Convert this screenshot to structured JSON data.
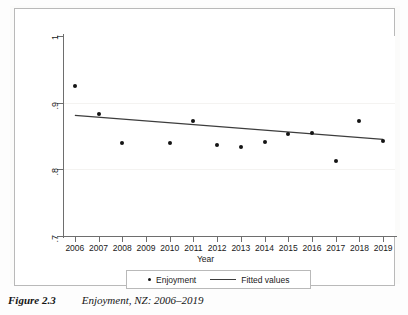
{
  "caption": {
    "number": "Figure 2.3",
    "text": "Enjoyment, NZ: 2006–2019"
  },
  "legend": {
    "series_label": "Enjoyment",
    "fit_label": "Fitted values",
    "marker_icon": "filled-circle-marker-icon",
    "line_icon": "solid-line-icon"
  },
  "axes": {
    "x_title": "Year",
    "y_title": "",
    "y_ticks": [
      "1",
      ".9",
      ".8",
      ".7"
    ],
    "x_ticks": [
      "2006",
      "2007",
      "2008",
      "2009",
      "2010",
      "2011",
      "2012",
      "2013",
      "2014",
      "2015",
      "2016",
      "2017",
      "2018",
      "2019"
    ]
  },
  "colors": {
    "marker": "#141414",
    "fit_line": "#3d3d3d",
    "axis": "#6e6e6e",
    "frame": "#b9b9b9",
    "background": "#ffffff"
  },
  "chart_data": {
    "type": "scatter",
    "title": "Enjoyment, NZ: 2006–2019",
    "xlabel": "Year",
    "ylabel": "",
    "xlim": [
      2005.5,
      2019.5
    ],
    "ylim": [
      0.7,
      1.0
    ],
    "ytick_values": [
      1.0,
      0.9,
      0.8,
      0.7
    ],
    "ytick_labels": [
      "1",
      ".9",
      ".8",
      ".7"
    ],
    "xtick_values": [
      2006,
      2007,
      2008,
      2009,
      2010,
      2011,
      2012,
      2013,
      2014,
      2015,
      2016,
      2017,
      2018,
      2019
    ],
    "grid": false,
    "legend_position": "below-axes",
    "series": [
      {
        "name": "Enjoyment",
        "type": "scatter",
        "marker": "filled-circle",
        "color": "#141414",
        "x": [
          2006,
          2007,
          2008,
          2010,
          2011,
          2012,
          2013,
          2014,
          2015,
          2016,
          2017,
          2018,
          2019
        ],
        "values": [
          0.925,
          0.883,
          0.84,
          0.84,
          0.872,
          0.837,
          0.833,
          0.841,
          0.853,
          0.855,
          0.813,
          0.872,
          0.843
        ]
      },
      {
        "name": "Fitted values",
        "type": "line",
        "color": "#3d3d3d",
        "x": [
          2006,
          2019
        ],
        "values": [
          0.881,
          0.845
        ]
      }
    ]
  }
}
